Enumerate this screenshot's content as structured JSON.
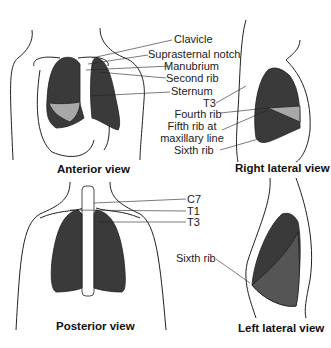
{
  "colors": {
    "lung_dark": "#3a3a3a",
    "lung_mid": "#555555",
    "lung_light": "#a8a8a8",
    "outline": "#222222"
  },
  "views": {
    "anterior": {
      "caption": "Anterior view",
      "labels": [
        "Clavicle",
        "Suprasternal notch",
        "Manubrium",
        "Second rib",
        "Sternum"
      ]
    },
    "right_lateral": {
      "caption": "Right lateral view",
      "labels": [
        "T3",
        "Fourth rib",
        "Fifth rib at",
        "maxillary line",
        "Sixth rib"
      ]
    },
    "posterior": {
      "caption": "Posterior view",
      "labels": [
        "C7",
        "T1",
        "T3"
      ]
    },
    "left_lateral": {
      "caption": "Left lateral view",
      "labels": [
        "Sixth rib"
      ]
    }
  }
}
